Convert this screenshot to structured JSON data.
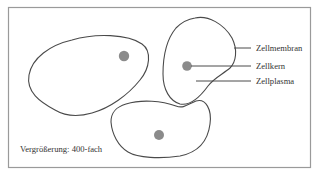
{
  "diagram": {
    "type": "labeled-illustration",
    "labels": {
      "membrane": "Zellmembran",
      "nucleus": "Zellkern",
      "cytoplasm": "Zellplasma"
    },
    "caption": "Vergrößerung: 400-fach",
    "cells": [
      {
        "id": "cell-large-left",
        "nucleus_center": [
          124,
          56
        ]
      },
      {
        "id": "cell-right-labeled",
        "nucleus_center": [
          187,
          66
        ]
      },
      {
        "id": "cell-bottom",
        "nucleus_center": [
          159,
          135
        ]
      }
    ],
    "colors": {
      "outline": "#4a4a4a",
      "frame": "#9a9a9a",
      "nucleus": "#555555",
      "text": "#333333"
    }
  }
}
